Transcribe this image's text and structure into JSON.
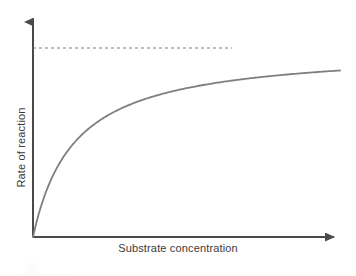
{
  "figure": {
    "width": 356,
    "height": 276,
    "background_color": "#ffffff"
  },
  "axes": {
    "x_label": "Substrate concentration",
    "y_label": "Rate of reaction",
    "axis_color": "#4a4a4a",
    "label_color": "#3b3b3b",
    "origin_px": {
      "x": 33,
      "y": 237
    },
    "x_axis_end_px": {
      "x": 343,
      "y": 237
    },
    "y_axis_end_px": {
      "x": 33,
      "y": 16
    },
    "arrowheads": true,
    "tick_labels_x": [],
    "tick_labels_y": [],
    "grid": false
  },
  "asymptote": {
    "label": "",
    "style": "dashed",
    "color": "#7d7d7d",
    "y_px": 48,
    "x_start_px": 33,
    "x_end_px": 232
  },
  "curve": {
    "color": "#7f7f7f",
    "width_px": 1.8,
    "style": "solid"
  },
  "chart_data": {
    "type": "line",
    "title": "",
    "subtitle": "",
    "xlabel": "Substrate concentration",
    "ylabel": "Rate of reaction",
    "xlim": [
      0,
      1
    ],
    "ylim": [
      0,
      1.06
    ],
    "grid": false,
    "legend": null,
    "model": "Michaelis-Menten: v = Vmax * S / (Km + S)",
    "vmax": 1.0,
    "km": 0.135,
    "annotations": [
      {
        "type": "asymptote-line",
        "orientation": "horizontal",
        "value": 1.0,
        "style": "dashed",
        "label": ""
      }
    ],
    "series": [
      {
        "name": "Rate of reaction",
        "x": [
          0,
          0.02,
          0.04,
          0.06,
          0.08,
          0.1,
          0.13,
          0.16,
          0.2,
          0.25,
          0.3,
          0.35,
          0.4,
          0.45,
          0.5,
          0.55,
          0.6,
          0.65,
          0.7,
          0.75,
          0.8,
          0.85,
          0.9,
          0.95,
          1.0
        ],
        "values": [
          0,
          0.129,
          0.229,
          0.308,
          0.372,
          0.426,
          0.491,
          0.542,
          0.597,
          0.649,
          0.69,
          0.722,
          0.748,
          0.769,
          0.787,
          0.803,
          0.816,
          0.828,
          0.838,
          0.847,
          0.856,
          0.863,
          0.87,
          0.876,
          0.881
        ]
      }
    ]
  }
}
